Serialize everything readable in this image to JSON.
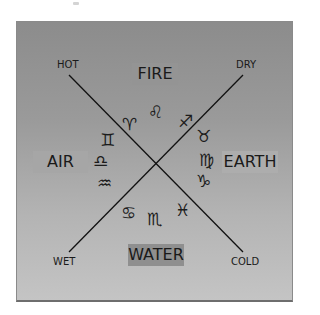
{
  "diagram": {
    "type": "elements-qualities-zodiac",
    "background_gradient": [
      "#8c8c8c",
      "#c4c4c4"
    ],
    "line_color": "#111111",
    "elements": {
      "fire": "FIRE",
      "air": "AIR",
      "earth": "EARTH",
      "water": "WATER"
    },
    "qualities": {
      "hot": "HOT",
      "dry": "DRY",
      "wet": "WET",
      "cold": "COLD"
    },
    "signs": {
      "aries": "♈",
      "leo": "♌",
      "sagittarius": "♐",
      "taurus": "♉",
      "virgo": "♍",
      "capricorn": "♑",
      "gemini": "♊",
      "libra": "♎",
      "aquarius": "♒",
      "cancer": "♋",
      "scorpio": "♏",
      "pisces": "♓"
    },
    "groups": {
      "fire": [
        "aries",
        "leo",
        "sagittarius"
      ],
      "earth": [
        "taurus",
        "virgo",
        "capricorn"
      ],
      "air": [
        "gemini",
        "libra",
        "aquarius"
      ],
      "water": [
        "cancer",
        "scorpio",
        "pisces"
      ]
    }
  }
}
